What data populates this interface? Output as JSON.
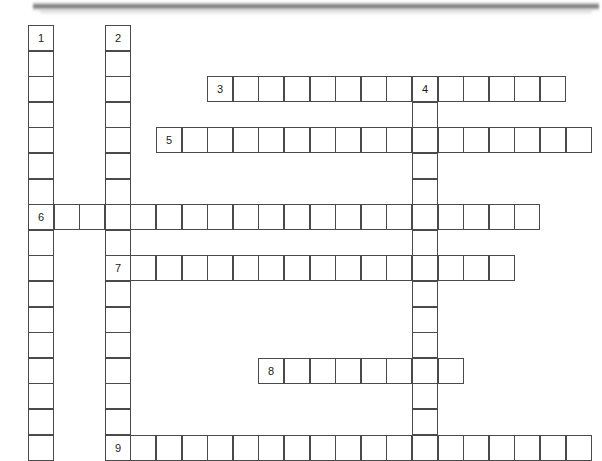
{
  "page": {
    "kind": "crossword-puzzle-grid",
    "background_color": "#ffffff",
    "cell_border_color": "#4a4a4a",
    "cell_fill_color": "#ffffff",
    "number_color": "#1b1b1b",
    "width": 602,
    "height": 461
  },
  "header_bar": {
    "present": true,
    "color": "#5c5c5c",
    "label": ""
  },
  "grid": {
    "cell_size": 25.6,
    "origin_x": 28,
    "origin_y": 25,
    "columns": 22,
    "rows": 17,
    "numbered_clues": [
      "1",
      "2",
      "3",
      "4",
      "5",
      "6",
      "7",
      "8",
      "9"
    ]
  },
  "entries": [
    {
      "number": "1",
      "direction": "down",
      "start_col": 0,
      "start_row": 0,
      "length": 17,
      "answer": ""
    },
    {
      "number": "2",
      "direction": "down",
      "start_col": 3,
      "start_row": 0,
      "length": 17,
      "answer": ""
    },
    {
      "number": "3",
      "direction": "across",
      "start_col": 7,
      "start_row": 2,
      "length": 14,
      "answer": ""
    },
    {
      "number": "4",
      "direction": "down",
      "start_col": 15,
      "start_row": 2,
      "length": 15,
      "answer": ""
    },
    {
      "number": "5",
      "direction": "across",
      "start_col": 5,
      "start_row": 4,
      "length": 17,
      "answer": ""
    },
    {
      "number": "6",
      "direction": "across",
      "start_col": 0,
      "start_row": 7,
      "length": 20,
      "answer": ""
    },
    {
      "number": "7",
      "direction": "across",
      "start_col": 3,
      "start_row": 9,
      "length": 16,
      "answer": ""
    },
    {
      "number": "8",
      "direction": "across",
      "start_col": 9,
      "start_row": 13,
      "length": 8,
      "answer": ""
    },
    {
      "number": "9",
      "direction": "across",
      "start_col": 3,
      "start_row": 16,
      "length": 19,
      "answer": ""
    }
  ]
}
